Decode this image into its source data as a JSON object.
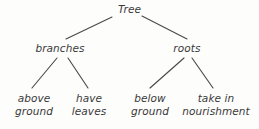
{
  "diagram": {
    "type": "tree-diagram",
    "title": "Tree",
    "background_color": "#fdfdfc",
    "ink_color": "#3a3a3a",
    "nodes": {
      "root": {
        "label": "Tree"
      },
      "level2": [
        {
          "label": "branches"
        },
        {
          "label": "roots"
        }
      ],
      "level3": [
        {
          "line1": "above",
          "line2": "ground"
        },
        {
          "line1": "have",
          "line2": "leaves"
        },
        {
          "line1": "below",
          "line2": "ground"
        },
        {
          "line1": "take in",
          "line2": "nourishment"
        }
      ]
    },
    "edges": [
      {
        "from": "Tree",
        "to": "branches",
        "x1": 112,
        "y1": 17,
        "x2": 66,
        "y2": 39
      },
      {
        "from": "Tree",
        "to": "roots",
        "x1": 142,
        "y1": 16,
        "x2": 187,
        "y2": 39
      },
      {
        "from": "branches",
        "to": "above ground",
        "x1": 57,
        "y1": 58,
        "x2": 32,
        "y2": 88
      },
      {
        "from": "branches",
        "to": "have leaves",
        "x1": 68,
        "y1": 58,
        "x2": 88,
        "y2": 88
      },
      {
        "from": "roots",
        "to": "below ground",
        "x1": 184,
        "y1": 58,
        "x2": 150,
        "y2": 88
      },
      {
        "from": "roots",
        "to": "take in nourishment",
        "x1": 192,
        "y1": 58,
        "x2": 213,
        "y2": 88
      }
    ]
  }
}
